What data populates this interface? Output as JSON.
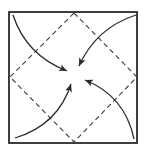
{
  "diagram": {
    "type": "origami-fold-diagram",
    "colors": {
      "background": "#ffffff",
      "stroke": "#2b2b2b",
      "dash": "#3a3a3a"
    },
    "square": {
      "x": 9,
      "y": 12,
      "width": 128,
      "height": 131
    },
    "fold_lines": {
      "style": "dashed",
      "vertices": [
        {
          "name": "top",
          "x": 74,
          "y": 13
        },
        {
          "name": "right",
          "x": 137,
          "y": 77
        },
        {
          "name": "bottom",
          "x": 74,
          "y": 142
        },
        {
          "name": "left",
          "x": 10,
          "y": 77
        }
      ]
    },
    "center": {
      "x": 74,
      "y": 77
    },
    "arrows": [
      {
        "name": "top-left-corner-arrow",
        "from": "top-left",
        "path": "M13,15 Q26,55 67,71",
        "head": {
          "x": 67,
          "y": 71,
          "angle": 25
        }
      },
      {
        "name": "top-right-corner-arrow",
        "from": "top-right",
        "path": "M136,15 Q96,28 79,66",
        "head": {
          "x": 79,
          "y": 66,
          "angle": 115
        }
      },
      {
        "name": "bottom-left-corner-arrow",
        "from": "bottom-left",
        "path": "M15,138 Q58,125 71,84",
        "head": {
          "x": 71,
          "y": 84,
          "angle": -72
        }
      },
      {
        "name": "bottom-right-corner-arrow",
        "from": "bottom-right",
        "path": "M134,139 Q125,96 85,80",
        "head": {
          "x": 85,
          "y": 80,
          "angle": -158
        }
      }
    ]
  }
}
